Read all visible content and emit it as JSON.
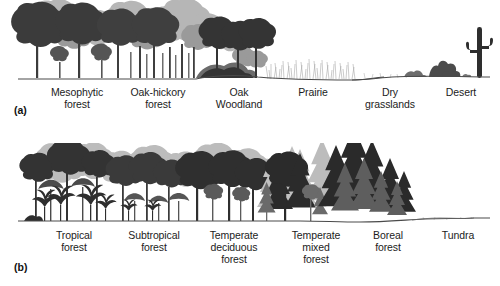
{
  "figure": {
    "title_alt": "Vegetation gradients diagram",
    "background_color": "#ffffff",
    "ink_color": "#2b2b2b"
  },
  "panels": [
    {
      "tag": "(a)",
      "tag_x": 48,
      "tag_y": 105,
      "gradient_name": "moisture gradient",
      "ground_color": "#4a4a4a",
      "zones": [
        {
          "label": "Mesophytic\nforest",
          "label_x": 34,
          "label_width": 86,
          "type": "tall-broadleaf-dense"
        },
        {
          "label": "Oak-hickory\nforest",
          "label_x": 113,
          "label_width": 90,
          "type": "tall-broadleaf-open"
        },
        {
          "label": "Oak\nWoodland",
          "label_x": 200,
          "label_width": 78,
          "type": "short-broadleaf-scrub"
        },
        {
          "label": "Prairie",
          "label_x": 278,
          "label_width": 70,
          "type": "grass"
        },
        {
          "label": "Dry\ngrasslands",
          "label_x": 352,
          "label_width": 76,
          "type": "sparse-grass"
        },
        {
          "label": "Desert",
          "label_x": 428,
          "label_width": 66,
          "type": "cactus-shrub"
        }
      ]
    },
    {
      "tag": "(b)",
      "tag_x": 48,
      "tag_y": 262,
      "gradient_name": "temperature / latitude gradient",
      "ground_color": "#4a4a4a",
      "zones": [
        {
          "label": "Tropical\nforest",
          "label_x": 32,
          "label_width": 84,
          "type": "rainforest-palms"
        },
        {
          "label": "Subtropical\nforest",
          "label_x": 110,
          "label_width": 88,
          "type": "subtropical"
        },
        {
          "label": "Temperate\ndeciduous\nforest",
          "label_x": 188,
          "label_width": 92,
          "type": "deciduous"
        },
        {
          "label": "Temperate\nmixed\nforest",
          "label_x": 272,
          "label_width": 88,
          "type": "mixed"
        },
        {
          "label": "Boreal\nforest",
          "label_x": 352,
          "label_width": 72,
          "type": "conifer"
        },
        {
          "label": "Tundra",
          "label_x": 424,
          "label_width": 68,
          "type": "tundra"
        }
      ]
    }
  ]
}
